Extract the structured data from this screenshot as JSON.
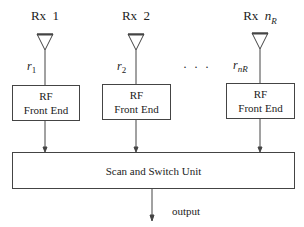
{
  "diagram": {
    "receivers": [
      {
        "label": "Rx  1",
        "signal": "r",
        "signal_sub": "1",
        "front_end_line1": "RF",
        "front_end_line2": "Front End"
      },
      {
        "label": "Rx  2",
        "signal": "r",
        "signal_sub": "2",
        "front_end_line1": "RF",
        "front_end_line2": "Front End"
      },
      {
        "label_prefix": "Rx  ",
        "label_var": "n",
        "label_var_sub": "R",
        "signal": "r",
        "signal_sub": "nR",
        "front_end_line1": "RF",
        "front_end_line2": "Front End"
      }
    ],
    "ellipsis": "· · ·",
    "combiner_label": "Scan and Switch Unit",
    "output_label": "output",
    "colors": {
      "line": "#444444",
      "text": "#222222",
      "background": "#ffffff"
    }
  }
}
